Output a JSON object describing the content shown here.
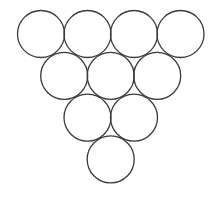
{
  "diagram": {
    "stroke_color": "#3a3a3a",
    "fill_color": "#ffffff",
    "background": "#ffffff",
    "radius": 23.5,
    "stroke_width": 1.3,
    "rows": [
      {
        "count": 4,
        "cy": 34,
        "cx": [
          41,
          87.5,
          134,
          180.5
        ]
      },
      {
        "count": 3,
        "cy": 75.8,
        "cx": [
          64.2,
          110.7,
          157.2
        ]
      },
      {
        "count": 2,
        "cy": 117.6,
        "cx": [
          87.5,
          134
        ]
      },
      {
        "count": 1,
        "cy": 159.4,
        "cx": [
          110.7
        ]
      }
    ]
  }
}
